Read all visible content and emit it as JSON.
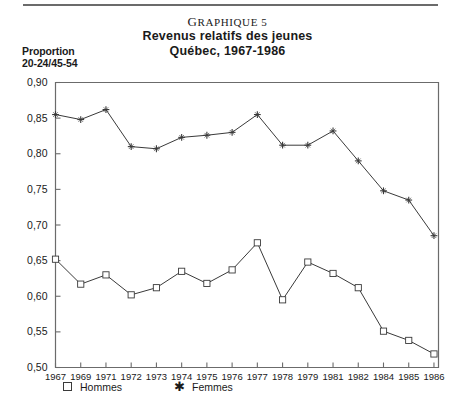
{
  "figure": {
    "number_prefix": "G",
    "number_rest": "RAPHIQUE",
    "number_value": "5",
    "number_full": "Graphique 5",
    "title_line1": "Revenus relatifs des jeunes",
    "title_line2": "Québec, 1967-1986",
    "axis_caption_line1": "Proportion",
    "axis_caption_line2": "20-24/45-54"
  },
  "legend": {
    "men_label": "Hommes",
    "men_marker": "square-marker",
    "women_label": "Femmes",
    "women_marker": "star-marker"
  },
  "chart_data": {
    "type": "line",
    "title": "Revenus relatifs des jeunes Québec, 1967-1986",
    "xlabel": "",
    "ylabel": "Proportion 20-24/45-54",
    "ylim": [
      0.5,
      0.9
    ],
    "ytick_labels": [
      "0,90",
      "0,85",
      "0,80",
      "0,75",
      "0,70",
      "0,65",
      "0,60",
      "0,55",
      "0,50"
    ],
    "yticks": [
      0.9,
      0.85,
      0.8,
      0.75,
      0.7,
      0.65,
      0.6,
      0.55,
      0.5
    ],
    "grid": false,
    "legend_position": "below-axis",
    "categories": [
      "1967",
      "1969",
      "1971",
      "1972",
      "1973",
      "1974",
      "1975",
      "1976",
      "1977",
      "1978",
      "1979",
      "1981",
      "1982",
      "1984",
      "1985",
      "1986"
    ],
    "xtick_labels": [
      "1967",
      "1969",
      "1971",
      "1972",
      "1973",
      "1974",
      "1975",
      "1976",
      "1977",
      "1978",
      "1979",
      "1981",
      "1982",
      "1984",
      "1985",
      "1986"
    ],
    "series": [
      {
        "name": "Femmes",
        "marker": "star",
        "values": [
          0.855,
          0.848,
          0.862,
          0.81,
          0.807,
          0.823,
          0.826,
          0.83,
          0.855,
          0.812,
          0.812,
          0.832,
          0.79,
          0.748,
          0.735,
          0.685
        ]
      },
      {
        "name": "Hommes",
        "marker": "square",
        "values": [
          0.652,
          0.617,
          0.63,
          0.602,
          0.612,
          0.635,
          0.618,
          0.637,
          0.675,
          0.595,
          0.648,
          0.632,
          0.612,
          0.551,
          0.538,
          0.519
        ]
      }
    ]
  },
  "colors": {
    "line": "#3a3a3a",
    "axis": "#6b6b6b",
    "text": "#1a1a1a",
    "marker_fill": "#ffffff"
  }
}
